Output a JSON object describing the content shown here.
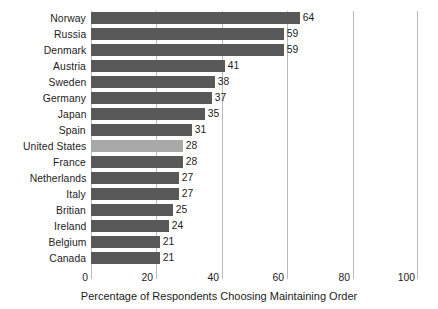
{
  "chart_data": {
    "type": "bar",
    "orientation": "horizontal",
    "title": "",
    "xlabel": "Percentage of Respondents Choosing Maintaining Order",
    "ylabel": "",
    "xlim": [
      0,
      100
    ],
    "xticks": [
      0,
      20,
      40,
      60,
      80,
      100
    ],
    "xtick_labels": [
      "0",
      "20",
      "40",
      "60",
      "80",
      "100"
    ],
    "grid": true,
    "grid_axis": "x",
    "legend": "none",
    "categories": [
      "Norway",
      "Russia",
      "Denmark",
      "Austria",
      "Sweden",
      "Germany",
      "Japan",
      "Spain",
      "United States",
      "France",
      "Netherlands",
      "Italy",
      "Britian",
      "Ireland",
      "Belgium",
      "Canada"
    ],
    "values": [
      64,
      59,
      59,
      41,
      38,
      37,
      35,
      31,
      28,
      28,
      27,
      27,
      25,
      24,
      21,
      21
    ],
    "value_labels": [
      "64",
      "59",
      "59",
      "41",
      "38",
      "37",
      "35",
      "31",
      "28",
      "28",
      "27",
      "27",
      "25",
      "24",
      "21",
      "21"
    ],
    "highlight_category": "United States",
    "colors": {
      "bar": "#595959",
      "bar_highlight": "#a8a8a8",
      "gridline": "#b9b9b9",
      "text": "#1c1c1c",
      "background": "#ffffff"
    }
  }
}
